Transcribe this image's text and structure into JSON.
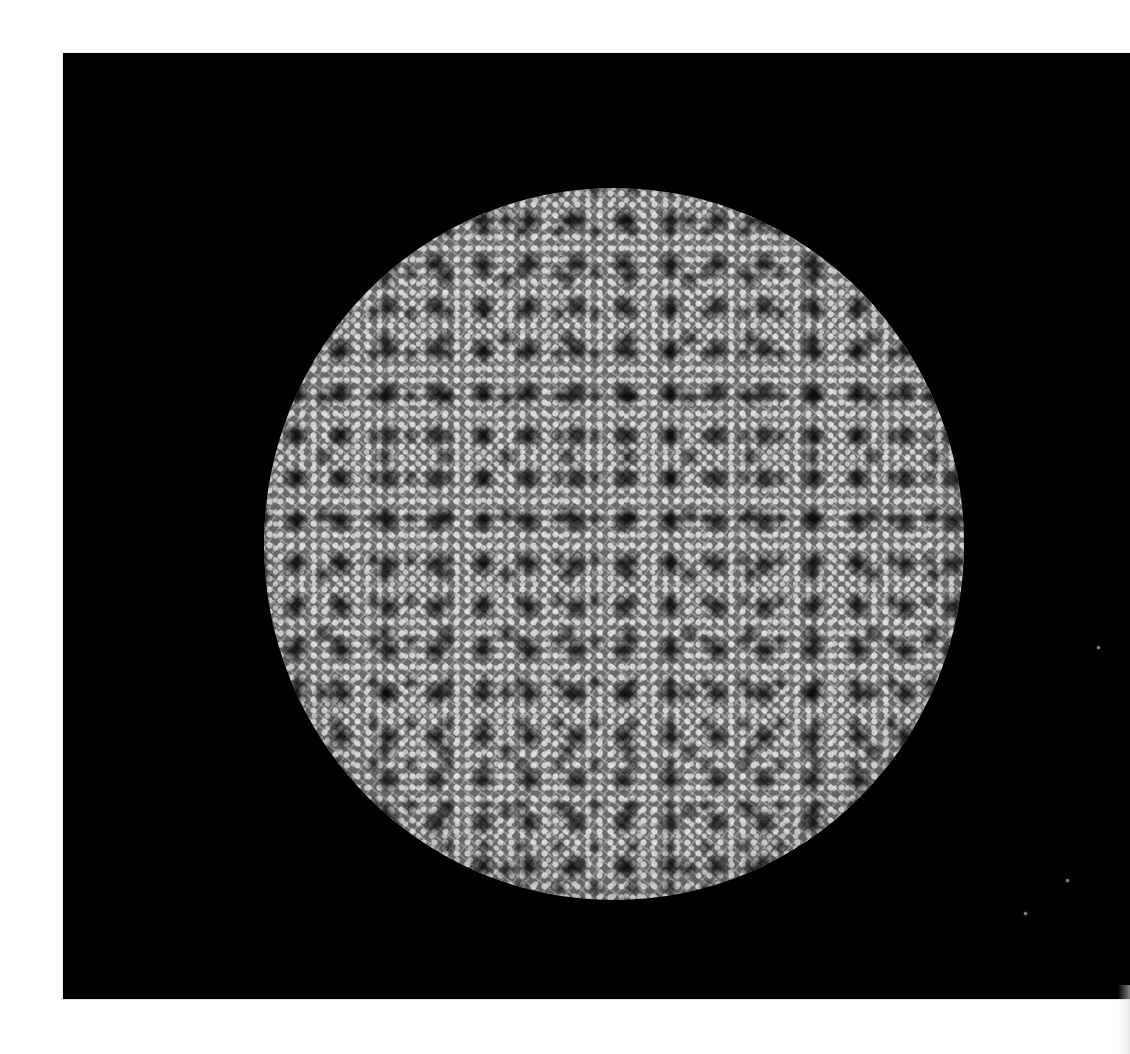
{
  "image": {
    "subject": "textured-sphere",
    "background_color": "#000000",
    "page_color": "#ffffff",
    "sphere_base_color": "#6b6b6b",
    "pattern_highlight_color": "#d7d7d7",
    "defect_color": "#000000"
  },
  "stars": [
    {
      "x": 1098,
      "y": 647
    },
    {
      "x": 1067,
      "y": 880
    },
    {
      "x": 1025,
      "y": 913
    }
  ]
}
